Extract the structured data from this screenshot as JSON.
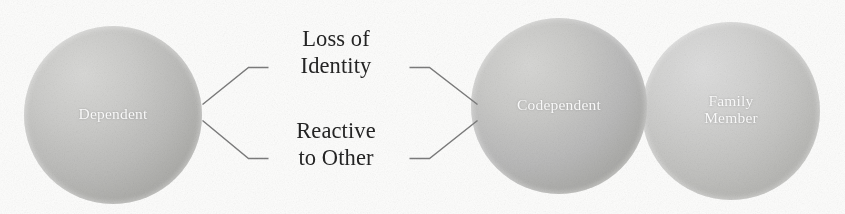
{
  "diagram": {
    "background_color": "#fdfdfc",
    "nodes": [
      {
        "id": "dependent",
        "label": "Dependent",
        "shape": "circle",
        "fill_color": "#bcbcba",
        "text_color": "#fefefe"
      },
      {
        "id": "codependent",
        "label": "Codependent",
        "shape": "circle",
        "fill_color": "#bababa",
        "text_color": "#fefefe"
      },
      {
        "id": "family-member",
        "label": "Family\nMember",
        "shape": "circle",
        "fill_color": "#c4c4c2",
        "text_color": "#fefefe"
      }
    ],
    "connector_labels": [
      {
        "id": "loss-of-identity",
        "text": "Loss of\nIdentity",
        "text_color": "#252525"
      },
      {
        "id": "reactive-to-other",
        "text": "Reactive\nto Other",
        "text_color": "#252525"
      }
    ],
    "connectors": {
      "stroke_color": "#7c7c7c",
      "left_bracket_description": "two lines fanning right from Dependent circle edge",
      "right_bracket_description": "two lines converging left onto Codependent circle edge"
    }
  }
}
